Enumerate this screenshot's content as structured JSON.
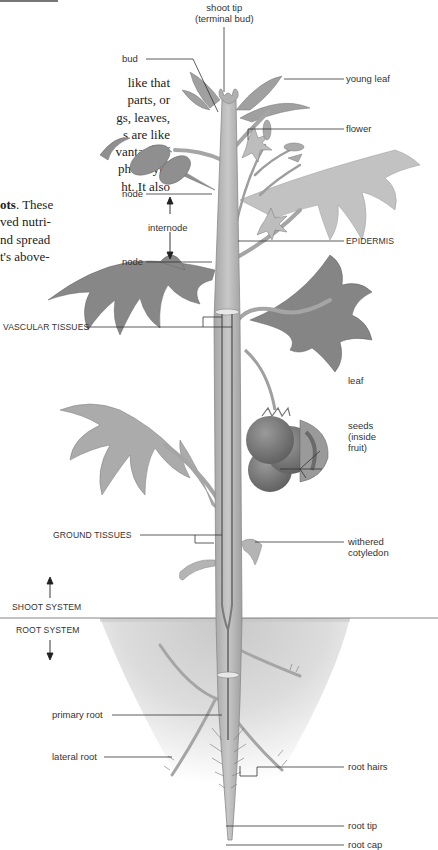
{
  "figure": {
    "text_fragment_top": [
      "like that",
      "parts, or",
      "gs, leaves,",
      "s are like",
      "vantage of",
      "photosyn-",
      "ht. It also"
    ],
    "text_fragment_bottom": {
      "bold_lead": "ots",
      "lines_after": [
        ". These",
        "ved nutri-",
        "nd spread",
        "t's above-"
      ]
    },
    "labels": {
      "shoot_tip": [
        "shoot tip",
        "(terminal bud)"
      ],
      "bud": "bud",
      "young_leaf": "young leaf",
      "flower": "flower",
      "node_upper": "node",
      "internode": "internode",
      "node_lower": "node",
      "epidermis": "EPIDERMIS",
      "vascular_tissues": "VASCULAR TISSUES",
      "leaf": "leaf",
      "seeds": [
        "seeds",
        "(inside",
        "fruit)"
      ],
      "ground_tissues": "GROUND TISSUES",
      "withered_cotyledon": [
        "withered",
        "cotyledon"
      ],
      "shoot_system": "SHOOT SYSTEM",
      "root_system": "ROOT SYSTEM",
      "primary_root": "primary root",
      "lateral_root": "lateral root",
      "root_hairs": "root hairs",
      "root_tip": "root tip",
      "root_cap": "root cap"
    },
    "colors": {
      "stem": "#b9b9b9",
      "stem_dark": "#8a8a8a",
      "leaf": "#8f8f8f",
      "leaf_light": "#b8b8b8",
      "fruit": "#7a7a7a",
      "soil": "#d4d4d4",
      "line": "#333333"
    }
  }
}
